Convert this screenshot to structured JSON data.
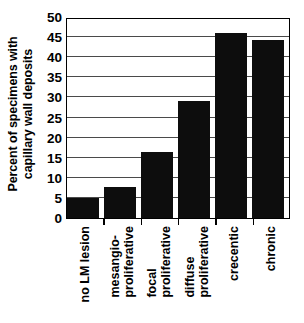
{
  "chart_data": {
    "type": "bar",
    "title": "",
    "xlabel": "",
    "ylabel": "Percent of specimens with capillary wall deposits",
    "ylabel_lines": [
      "Percent of specimens with",
      "capillary wall deposits"
    ],
    "categories": [
      "no LM lesion",
      "mesangio-proliferative",
      "focal proliferative",
      "diffuse proliferative",
      "crecentic",
      "chronic"
    ],
    "category_lines": [
      [
        "no LM lesion"
      ],
      [
        "mesangio-",
        "proliferative"
      ],
      [
        "focal",
        "proliferative"
      ],
      [
        "diffuse",
        "proliferative"
      ],
      [
        "crecentic"
      ],
      [
        "chronic"
      ]
    ],
    "values": [
      5.0,
      7.7,
      16.4,
      29.0,
      46.0,
      44.3
    ],
    "ylim": [
      0,
      50
    ],
    "ytick_step": 5,
    "yticks": [
      0,
      5,
      10,
      15,
      20,
      25,
      30,
      35,
      40,
      45,
      50
    ],
    "ytick_labels": [
      "0",
      "5",
      "10",
      "15",
      "20",
      "25",
      "30",
      "35",
      "40",
      "45",
      "50"
    ],
    "grid": true,
    "grid_axis": "y",
    "legend": false,
    "bar_color": "#0d0d0d",
    "axis_color": "#000000",
    "grid_color": "#4a4a4a",
    "background": "#ffffff"
  }
}
